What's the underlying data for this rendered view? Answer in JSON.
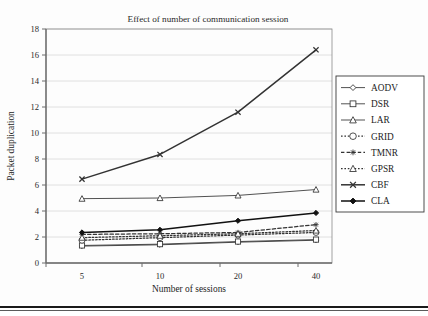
{
  "chart_data": {
    "type": "line",
    "title": "Effect of number of communication session",
    "xlabel": "Number of sessions",
    "ylabel": "Packet duplication",
    "categories": [
      "5",
      "10",
      "20",
      "40"
    ],
    "x": [
      5,
      10,
      20,
      40
    ],
    "ylim": [
      0,
      18
    ],
    "yticks": [
      0,
      2,
      4,
      6,
      8,
      10,
      12,
      14,
      16,
      18
    ],
    "ytick_labels": [
      "0",
      "2",
      "4",
      "6",
      "8",
      "10",
      "12",
      "14",
      "16",
      "18"
    ],
    "grid": "horizontal",
    "legend_position": "right",
    "series": [
      {
        "name": "AODV",
        "values": [
          1.3,
          1.4,
          1.6,
          1.75
        ],
        "marker": "diamond-open",
        "line": "solid"
      },
      {
        "name": "DSR",
        "values": [
          1.35,
          1.45,
          1.65,
          1.8
        ],
        "marker": "square-open",
        "line": "solid"
      },
      {
        "name": "LAR",
        "values": [
          4.95,
          5.0,
          5.2,
          5.65
        ],
        "marker": "triangle-open",
        "line": "solid"
      },
      {
        "name": "GRID",
        "values": [
          1.75,
          1.95,
          2.15,
          2.35
        ],
        "marker": "circle-open",
        "line": "dotted"
      },
      {
        "name": "TMNR",
        "values": [
          2.2,
          2.25,
          2.35,
          2.95
        ],
        "marker": "asterisk",
        "line": "dashed"
      },
      {
        "name": "GPSR",
        "values": [
          1.95,
          2.1,
          2.25,
          2.5
        ],
        "marker": "triangle-open",
        "line": "dotted"
      },
      {
        "name": "CBF",
        "values": [
          6.45,
          8.35,
          11.6,
          16.4
        ],
        "marker": "cross-x",
        "line": "solid"
      },
      {
        "name": "CLA",
        "values": [
          2.35,
          2.55,
          3.25,
          3.85
        ],
        "marker": "diamond-filled",
        "line": "solid"
      }
    ]
  },
  "legend": {
    "entries": [
      {
        "label": "AODV"
      },
      {
        "label": "DSR"
      },
      {
        "label": "LAR"
      },
      {
        "label": "GRID"
      },
      {
        "label": "TMNR"
      },
      {
        "label": "GPSR"
      },
      {
        "label": "CBF"
      },
      {
        "label": "CLA"
      }
    ]
  },
  "colors": {
    "line": "#333333",
    "cla": "#111111",
    "grid": "#d8d8d8",
    "axis": "#6d6d6d",
    "text": "#1f1f1f",
    "background": "#fdfdfd"
  }
}
